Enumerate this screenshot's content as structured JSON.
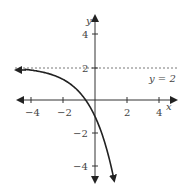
{
  "chart_data": {
    "type": "line",
    "title": "",
    "xlabel": "x",
    "ylabel": "y",
    "xlim": [
      -5,
      5
    ],
    "ylim": [
      -5,
      5
    ],
    "x_ticks": [
      "-4",
      "-2",
      "2",
      "4"
    ],
    "y_ticks": [
      "4",
      "2",
      "-2",
      "-4"
    ],
    "grid": false,
    "asymptote": {
      "label": "y = 2",
      "y": 2,
      "style": "dashed"
    },
    "series": [
      {
        "name": "curve",
        "x": [
          -5,
          -4,
          -3,
          -2,
          -1,
          -0.5,
          0,
          0.5,
          1,
          1.2
        ],
        "values": [
          1.9,
          1.8,
          1.6,
          1.25,
          0.5,
          -0.1,
          -1,
          -2.2,
          -4,
          -4.9
        ]
      }
    ]
  },
  "labels": {
    "x": "x",
    "y": "y",
    "asym": "y = 2",
    "xt": [
      "−4",
      "−2",
      "2",
      "4"
    ],
    "yt": [
      "4",
      "2",
      "−2",
      "−4"
    ]
  }
}
